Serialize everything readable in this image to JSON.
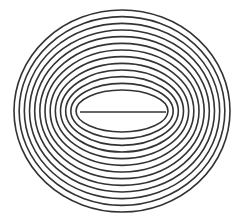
{
  "diagram": {
    "title": "",
    "type": "concentric-ellipses",
    "center": {
      "x": 122,
      "y": 111
    },
    "ring_count": 13,
    "inner": {
      "rx": 46,
      "ry": 21
    },
    "outer": {
      "rx": 108,
      "ry": 101
    },
    "stroke_color": "#333333",
    "stroke_width": 1.6,
    "background": "#ffffff",
    "center_line": {
      "x1": 80,
      "x2": 166,
      "y": 112
    }
  }
}
